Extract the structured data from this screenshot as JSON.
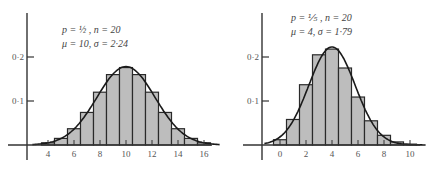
{
  "chart_data": [
    {
      "type": "bar",
      "title": "",
      "params": {
        "line1": "p = ½ ,  n = 20",
        "line2": "μ = 10,  σ = 2·24"
      },
      "xlabel": "",
      "ylabel": "",
      "x_ticks": [
        4,
        6,
        8,
        10,
        12,
        14,
        16
      ],
      "y_ticks": [
        "0·1",
        "0·2"
      ],
      "y_tick_values": [
        0.1,
        0.2
      ],
      "categories": [
        4,
        5,
        6,
        7,
        8,
        9,
        10,
        11,
        12,
        13,
        14,
        15,
        16
      ],
      "values": [
        0.005,
        0.015,
        0.037,
        0.074,
        0.12,
        0.16,
        0.176,
        0.16,
        0.12,
        0.074,
        0.037,
        0.015,
        0.005
      ],
      "overlay": "normal curve (μ = 10, σ = 2.24)",
      "ylim": [
        0,
        0.3
      ],
      "grid": false
    },
    {
      "type": "bar",
      "title": "",
      "params": {
        "line1": "p = ⅕ ,  n = 20",
        "line2": "μ = 4,  σ = 1·79"
      },
      "xlabel": "",
      "ylabel": "",
      "x_ticks": [
        0,
        2,
        4,
        6,
        8,
        10
      ],
      "y_ticks": [
        "0·1",
        "0·2"
      ],
      "y_tick_values": [
        0.1,
        0.2
      ],
      "categories": [
        0,
        1,
        2,
        3,
        4,
        5,
        6,
        7,
        8,
        9,
        10
      ],
      "values": [
        0.012,
        0.058,
        0.137,
        0.205,
        0.218,
        0.175,
        0.109,
        0.055,
        0.022,
        0.007,
        0.002
      ],
      "overlay": "normal curve (μ = 4, σ = 1.79)",
      "ylim": [
        0,
        0.3
      ],
      "grid": false
    }
  ],
  "style": {
    "bar_fill": "#bdbdbd",
    "bar_stroke": "#2a2a2a",
    "axis_color": "#333333",
    "curve_color": "#1a1a1a"
  }
}
